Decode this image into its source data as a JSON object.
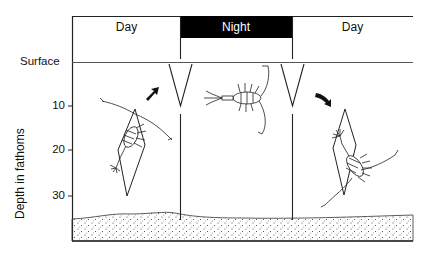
{
  "diagram": {
    "periods": [
      {
        "label": "Day",
        "shade": "light"
      },
      {
        "label": "Night",
        "shade": "dark"
      },
      {
        "label": "Day",
        "shade": "light"
      }
    ],
    "surface_label": "Surface",
    "y_axis": {
      "label": "Depth in fathoms",
      "ticks": [
        "10",
        "20",
        "30"
      ]
    },
    "annotations": {
      "left_arrow": "upward migration (ascending toward surface)",
      "right_arrow": "downward migration (descending to depth)"
    },
    "panels": [
      {
        "name": "day-left",
        "organism_position": "deep (~10-30 fathoms)",
        "range_indicator": "diamond 10-30"
      },
      {
        "name": "night",
        "organism_position": "near surface (~0-10 fathoms)",
        "range_indicator": "V shapes at boundaries"
      },
      {
        "name": "day-right",
        "organism_position": "deep (~10-30 fathoms)",
        "range_indicator": "diamond 10-30"
      }
    ],
    "colors": {
      "ink": "#111111",
      "night_fill": "#000000",
      "background": "#ffffff"
    }
  }
}
